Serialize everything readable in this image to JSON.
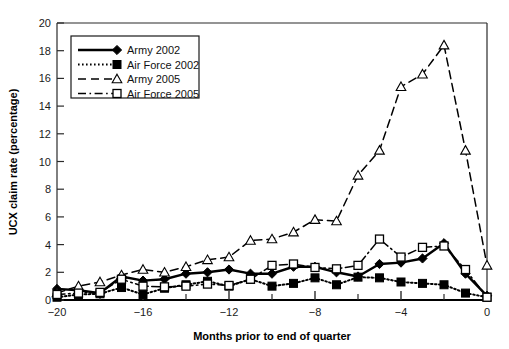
{
  "chart_data": {
    "type": "line",
    "title": "",
    "xlabel": "Months prior to end of quarter",
    "ylabel": "UCX claim rate (percentage)",
    "xlim": [
      -20,
      0
    ],
    "ylim": [
      0,
      20
    ],
    "xticks": [
      -20,
      -16,
      -12,
      -8,
      -4,
      0
    ],
    "xtick_labels": [
      "−20",
      "−16",
      "−12",
      "−8",
      "−4",
      "0"
    ],
    "xminorticks": [
      -18,
      -14,
      -10,
      -6,
      -2
    ],
    "yticks": [
      0,
      2,
      4,
      6,
      8,
      10,
      12,
      14,
      16,
      18,
      20
    ],
    "ytick_labels": [
      "0",
      "2",
      "4",
      "6",
      "8",
      "10",
      "12",
      "14",
      "16",
      "18",
      "20"
    ],
    "grid": false,
    "legend_position": "upper-left",
    "x": [
      -20,
      -19,
      -18,
      -17,
      -16,
      -15,
      -14,
      -13,
      -12,
      -11,
      -10,
      -9,
      -8,
      -7,
      -6,
      -5,
      -4,
      -3,
      -2,
      -1,
      0
    ],
    "series": [
      {
        "name": "Army 2002",
        "marker": "filled-diamond",
        "line_style": "solid",
        "color": "#000000",
        "values": [
          0.8,
          0.7,
          0.5,
          1.7,
          1.4,
          1.5,
          1.9,
          2.0,
          2.2,
          1.9,
          1.9,
          2.4,
          2.4,
          2.0,
          1.7,
          2.6,
          2.7,
          3.0,
          4.1,
          1.9,
          0.3
        ]
      },
      {
        "name": "Air Force 2002",
        "marker": "filled-square",
        "line_style": "dotted",
        "color": "#000000",
        "values": [
          0.2,
          0.4,
          0.45,
          0.9,
          0.4,
          0.85,
          1.1,
          1.35,
          1.0,
          1.5,
          1.0,
          1.2,
          1.6,
          1.1,
          1.65,
          1.6,
          1.3,
          1.2,
          1.1,
          0.5,
          0.2
        ]
      },
      {
        "name": "Army 2005",
        "marker": "open-triangle",
        "line_style": "dashed",
        "color": "#000000",
        "values": [
          0.5,
          1.0,
          1.3,
          1.8,
          2.2,
          2.0,
          2.4,
          2.9,
          3.1,
          4.3,
          4.4,
          4.9,
          5.8,
          5.7,
          9.0,
          10.8,
          15.4,
          16.3,
          18.4,
          10.8,
          2.5
        ]
      },
      {
        "name": "Air Force 2005",
        "marker": "open-square",
        "line_style": "dash-dot",
        "color": "#000000",
        "values": [
          0.4,
          0.5,
          0.55,
          1.5,
          1.0,
          0.95,
          1.0,
          1.15,
          1.05,
          1.5,
          2.5,
          2.6,
          2.35,
          2.25,
          2.5,
          4.4,
          3.1,
          3.8,
          3.9,
          2.2,
          0.2
        ]
      }
    ]
  },
  "legend": {
    "items": [
      {
        "label": "Army 2002"
      },
      {
        "label": "Air Force 2002"
      },
      {
        "label": "Army 2005"
      },
      {
        "label": "Air Force 2005"
      }
    ]
  },
  "colors": {
    "ink": "#000000",
    "background": "#ffffff",
    "axis": "#2b2b2b"
  }
}
